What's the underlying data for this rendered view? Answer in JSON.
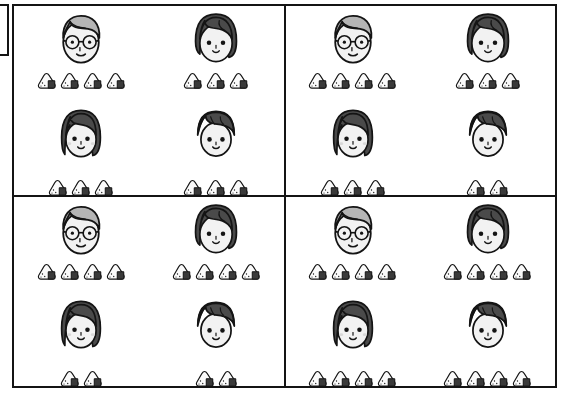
{
  "scene": {
    "title": "Family onigiri comparison grid",
    "layout": "2x2 panels, each panel shows 4 family members with onigiri counts",
    "colors": {
      "background": "#ffffff",
      "outline": "#141414",
      "hair_dark": "#4a4a4a",
      "hair_gray": "#b5b5b5",
      "skin": "#f2f2f2",
      "nori": "#3a3a3a",
      "rice": "#fafafa",
      "blush": "#d8d8d8"
    },
    "icons": {
      "onigiri": "onigiri-rice-ball-icon",
      "grandfather": "face-grandfather-glasses-icon",
      "mother": "face-mother-bob-icon",
      "girl": "face-girl-icon",
      "boy": "face-boy-icon"
    }
  },
  "panels": [
    {
      "id": "panel-1",
      "position": "top-left",
      "members": [
        {
          "name": "grandfather",
          "face": "grandfather",
          "onigiri": 4
        },
        {
          "name": "mother",
          "face": "mother",
          "onigiri": 3
        },
        {
          "name": "girl",
          "face": "girl",
          "onigiri": 3
        },
        {
          "name": "boy",
          "face": "boy",
          "onigiri": 3
        }
      ],
      "total": 13
    },
    {
      "id": "panel-2",
      "position": "top-right",
      "members": [
        {
          "name": "grandfather",
          "face": "grandfather",
          "onigiri": 4
        },
        {
          "name": "mother",
          "face": "mother",
          "onigiri": 3
        },
        {
          "name": "girl",
          "face": "girl",
          "onigiri": 3
        },
        {
          "name": "boy",
          "face": "boy",
          "onigiri": 2
        }
      ],
      "total": 12
    },
    {
      "id": "panel-3",
      "position": "bottom-left",
      "members": [
        {
          "name": "grandfather",
          "face": "grandfather",
          "onigiri": 4
        },
        {
          "name": "mother",
          "face": "mother",
          "onigiri": 4
        },
        {
          "name": "girl",
          "face": "girl",
          "onigiri": 2
        },
        {
          "name": "boy",
          "face": "boy",
          "onigiri": 2
        }
      ],
      "total": 12
    },
    {
      "id": "panel-4",
      "position": "bottom-right",
      "members": [
        {
          "name": "grandfather",
          "face": "grandfather",
          "onigiri": 4
        },
        {
          "name": "mother",
          "face": "mother",
          "onigiri": 4
        },
        {
          "name": "girl",
          "face": "girl",
          "onigiri": 4
        },
        {
          "name": "boy",
          "face": "boy",
          "onigiri": 4
        }
      ],
      "total": 16
    }
  ]
}
